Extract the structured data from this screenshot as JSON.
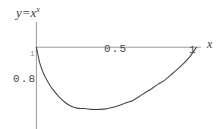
{
  "figure": {
    "function_label_base": "y=x",
    "function_label_exponent": "x",
    "axis_label_x": "x",
    "background_color": "#ffffff",
    "axis_color": "#9a9a9a",
    "curve_color": "#444444",
    "tick_text_color": "#4a4a4a"
  },
  "ticks": {
    "x_half": "0.5",
    "x_one": "1",
    "y_point_eight": "0.8",
    "y_one": "1"
  },
  "chart_data": {
    "type": "line",
    "xlabel": "x",
    "ylabel": "",
    "xlim": [
      0,
      1
    ],
    "ylim": [
      0.68,
      1.02
    ],
    "grid": false,
    "legend": null,
    "xticks": [
      0.5,
      1
    ],
    "xticklabels": [
      "0.5",
      "1"
    ],
    "yticks": [
      0.8,
      1
    ],
    "yticklabels": [
      "0.8",
      "1"
    ],
    "series": [
      {
        "name": "y = x^x",
        "x": [
          0.0,
          0.02,
          0.04,
          0.06,
          0.08,
          0.1,
          0.14,
          0.18,
          0.22,
          0.26,
          0.3,
          0.34,
          0.368,
          0.4,
          0.44,
          0.48,
          0.52,
          0.56,
          0.6,
          0.64,
          0.68,
          0.72,
          0.76,
          0.8,
          0.84,
          0.88,
          0.92,
          0.96,
          1.0
        ],
        "y": [
          1.0,
          0.925,
          0.879,
          0.845,
          0.818,
          0.794,
          0.756,
          0.727,
          0.707,
          0.698,
          0.697,
          0.693,
          0.6922,
          0.693,
          0.6965,
          0.7035,
          0.713,
          0.7255,
          0.736,
          0.7552,
          0.7762,
          0.795,
          0.8175,
          0.8365,
          0.8632,
          0.8903,
          0.92,
          0.9546,
          1.0
        ]
      }
    ],
    "annotations": [
      {
        "text": "y=x^x",
        "position": "top-left"
      },
      {
        "text": "x",
        "position": "axis-x-end"
      }
    ]
  }
}
